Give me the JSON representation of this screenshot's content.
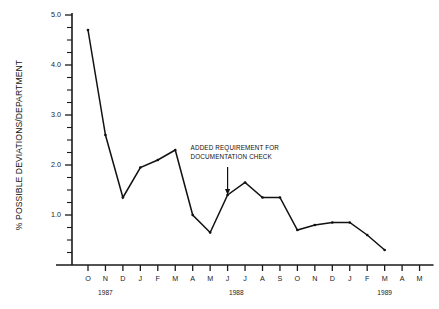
{
  "chart_data": {
    "type": "line",
    "title": "",
    "xlabel": "",
    "ylabel": "% POSSIBLE DEVIATIONS/DEPARTMENT",
    "ylim": [
      0,
      5.0
    ],
    "y_major_step": 1.0,
    "y_minor_step": 0.25,
    "y_tick_labels": [
      "1.0",
      "2.0",
      "3.0",
      "4.0",
      "5.0"
    ],
    "y_tick_values": [
      1.0,
      2.0,
      3.0,
      4.0,
      5.0
    ],
    "grid": false,
    "legend": "none",
    "categories": [
      "O",
      "N",
      "D",
      "J",
      "F",
      "M",
      "A",
      "M",
      "J",
      "J",
      "A",
      "S",
      "O",
      "N",
      "D",
      "J",
      "F",
      "M",
      "A",
      "M"
    ],
    "values": [
      4.7,
      2.6,
      1.35,
      1.95,
      2.1,
      2.3,
      1.0,
      0.65,
      1.4,
      1.65,
      1.35,
      1.35,
      0.7,
      0.8,
      0.85,
      0.85,
      0.6,
      0.3,
      null,
      null
    ],
    "series": [
      {
        "name": "% possible deviations/department",
        "values": [
          4.7,
          2.6,
          1.35,
          1.95,
          2.1,
          2.3,
          1.0,
          0.65,
          1.4,
          1.65,
          1.35,
          1.35,
          0.7,
          0.8,
          0.85,
          0.85,
          0.6,
          0.3,
          null,
          null
        ]
      }
    ],
    "year_groups": [
      {
        "label": "1987",
        "start_index": 0,
        "end_index": 2
      },
      {
        "label": "1988",
        "start_index": 3,
        "end_index": 14
      },
      {
        "label": "1989",
        "start_index": 15,
        "end_index": 19
      }
    ],
    "annotations": [
      {
        "lines": [
          "ADDED REQUIREMENT FOR",
          "DOCUMENTATION CHECK"
        ],
        "target_index": 8,
        "target_value": 1.4
      }
    ]
  }
}
